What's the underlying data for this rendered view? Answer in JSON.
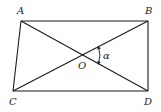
{
  "diagram": {
    "type": "quadrilateral-with-diagonals",
    "vertices": {
      "A": {
        "label": "A",
        "x": 21,
        "y": 21
      },
      "B": {
        "label": "B",
        "x": 148,
        "y": 21
      },
      "C": {
        "label": "C",
        "x": 13,
        "y": 91
      },
      "D": {
        "label": "D",
        "x": 148,
        "y": 91
      }
    },
    "intersection": {
      "label": "O",
      "x": 82.6,
      "y": 55
    },
    "angle": {
      "label": "α",
      "between": [
        "OB",
        "OD"
      ]
    },
    "edges": [
      "AB",
      "BD",
      "DC",
      "CA",
      "AD",
      "BC"
    ],
    "colors": {
      "stroke": "#1a1a1a",
      "text": "#222222",
      "background": "#ffffff"
    }
  }
}
